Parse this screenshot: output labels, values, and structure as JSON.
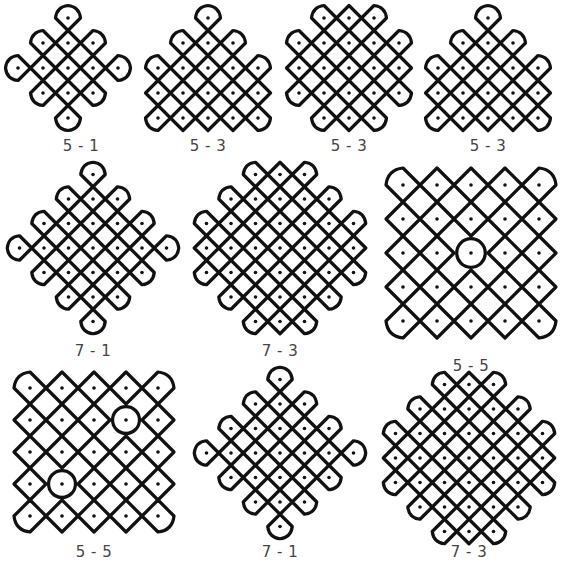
{
  "panels": [
    {
      "id": "p1",
      "caption": "5 - 1",
      "cx": 68,
      "cy": 68,
      "step": 25,
      "dots": [
        [
          0,
          -2
        ],
        [
          -1,
          -1
        ],
        [
          0,
          -1
        ],
        [
          1,
          -1
        ],
        [
          -2,
          0
        ],
        [
          -1,
          0
        ],
        [
          0,
          0
        ],
        [
          1,
          0
        ],
        [
          2,
          0
        ],
        [
          -1,
          1
        ],
        [
          0,
          1
        ],
        [
          1,
          1
        ],
        [
          0,
          2
        ]
      ],
      "caption_x": 41,
      "caption_y": 137
    },
    {
      "id": "p2",
      "caption": "5 - 3",
      "cx": 208,
      "cy": 68,
      "step": 25,
      "dots": [
        [
          0,
          -2
        ],
        [
          -1,
          -1
        ],
        [
          0,
          -1
        ],
        [
          1,
          -1
        ],
        [
          -2,
          0
        ],
        [
          -1,
          0
        ],
        [
          0,
          0
        ],
        [
          1,
          0
        ],
        [
          2,
          0
        ],
        [
          -2,
          1
        ],
        [
          -1,
          1
        ],
        [
          0,
          1
        ],
        [
          1,
          1
        ],
        [
          2,
          1
        ],
        [
          -2,
          2
        ],
        [
          -1,
          2
        ],
        [
          0,
          2
        ],
        [
          1,
          2
        ],
        [
          2,
          2
        ]
      ],
      "caption_x": 168,
      "caption_y": 137
    },
    {
      "id": "p3",
      "caption": "5 - 3",
      "cx": 349,
      "cy": 68,
      "step": 25,
      "dots": [
        [
          -1,
          -2
        ],
        [
          0,
          -2
        ],
        [
          1,
          -2
        ],
        [
          -2,
          -1
        ],
        [
          -1,
          -1
        ],
        [
          0,
          -1
        ],
        [
          1,
          -1
        ],
        [
          2,
          -1
        ],
        [
          -2,
          0
        ],
        [
          -1,
          0
        ],
        [
          0,
          0
        ],
        [
          1,
          0
        ],
        [
          2,
          0
        ],
        [
          -2,
          1
        ],
        [
          -1,
          1
        ],
        [
          0,
          1
        ],
        [
          1,
          1
        ],
        [
          2,
          1
        ],
        [
          -1,
          2
        ],
        [
          0,
          2
        ],
        [
          1,
          2
        ]
      ],
      "caption_x": 309,
      "caption_y": 137
    },
    {
      "id": "p4",
      "caption": "5 - 3",
      "cx": 488,
      "cy": 68,
      "step": 25,
      "dots": [
        [
          0,
          -2
        ],
        [
          -1,
          -1
        ],
        [
          0,
          -1
        ],
        [
          1,
          -1
        ],
        [
          -2,
          0
        ],
        [
          -1,
          0
        ],
        [
          0,
          0
        ],
        [
          1,
          0
        ],
        [
          2,
          0
        ],
        [
          -2,
          1
        ],
        [
          -1,
          1
        ],
        [
          0,
          1
        ],
        [
          1,
          1
        ],
        [
          2,
          1
        ],
        [
          -2,
          2
        ],
        [
          -1,
          2
        ],
        [
          0,
          2
        ],
        [
          1,
          2
        ],
        [
          2,
          2
        ]
      ],
      "caption_x": 448,
      "caption_y": 137
    },
    {
      "id": "p5",
      "caption": "7 - 1",
      "cx": 93,
      "cy": 248,
      "step": 24.5,
      "dots": [
        [
          0,
          -3
        ],
        [
          -1,
          -2
        ],
        [
          0,
          -2
        ],
        [
          1,
          -2
        ],
        [
          -2,
          -1
        ],
        [
          -1,
          -1
        ],
        [
          0,
          -1
        ],
        [
          1,
          -1
        ],
        [
          2,
          -1
        ],
        [
          -3,
          0
        ],
        [
          -2,
          0
        ],
        [
          -1,
          0
        ],
        [
          0,
          0
        ],
        [
          1,
          0
        ],
        [
          2,
          0
        ],
        [
          3,
          0
        ],
        [
          -2,
          1
        ],
        [
          -1,
          1
        ],
        [
          0,
          1
        ],
        [
          1,
          1
        ],
        [
          2,
          1
        ],
        [
          -1,
          2
        ],
        [
          0,
          2
        ],
        [
          1,
          2
        ],
        [
          0,
          3
        ]
      ],
      "caption_x": 53,
      "caption_y": 342
    },
    {
      "id": "p6",
      "caption": "7 - 3",
      "cx": 280,
      "cy": 248,
      "step": 24.5,
      "dots": [
        [
          -1,
          -3
        ],
        [
          0,
          -3
        ],
        [
          1,
          -3
        ],
        [
          -2,
          -2
        ],
        [
          -1,
          -2
        ],
        [
          0,
          -2
        ],
        [
          1,
          -2
        ],
        [
          2,
          -2
        ],
        [
          -3,
          -1
        ],
        [
          -2,
          -1
        ],
        [
          -1,
          -1
        ],
        [
          0,
          -1
        ],
        [
          1,
          -1
        ],
        [
          2,
          -1
        ],
        [
          3,
          -1
        ],
        [
          -3,
          0
        ],
        [
          -2,
          0
        ],
        [
          -1,
          0
        ],
        [
          0,
          0
        ],
        [
          1,
          0
        ],
        [
          2,
          0
        ],
        [
          3,
          0
        ],
        [
          -3,
          1
        ],
        [
          -2,
          1
        ],
        [
          -1,
          1
        ],
        [
          0,
          1
        ],
        [
          1,
          1
        ],
        [
          2,
          1
        ],
        [
          3,
          1
        ],
        [
          -2,
          2
        ],
        [
          -1,
          2
        ],
        [
          0,
          2
        ],
        [
          1,
          2
        ],
        [
          2,
          2
        ],
        [
          -1,
          3
        ],
        [
          0,
          3
        ],
        [
          1,
          3
        ]
      ],
      "caption_x": 240,
      "caption_y": 342
    },
    {
      "id": "p7",
      "caption": "5 - 5",
      "cx": 471,
      "cy": 253,
      "step": 34,
      "dots": [
        [
          -2,
          -2
        ],
        [
          -1,
          -2
        ],
        [
          0,
          -2
        ],
        [
          1,
          -2
        ],
        [
          2,
          -2
        ],
        [
          -2,
          -1
        ],
        [
          -1,
          -1
        ],
        [
          0,
          -1
        ],
        [
          1,
          -1
        ],
        [
          2,
          -1
        ],
        [
          -2,
          0
        ],
        [
          -1,
          0
        ],
        [
          0,
          0
        ],
        [
          1,
          0
        ],
        [
          2,
          0
        ],
        [
          -2,
          1
        ],
        [
          -1,
          1
        ],
        [
          0,
          1
        ],
        [
          1,
          1
        ],
        [
          2,
          1
        ],
        [
          -2,
          2
        ],
        [
          -1,
          2
        ],
        [
          0,
          2
        ],
        [
          1,
          2
        ],
        [
          2,
          2
        ]
      ],
      "circles": [
        [
          0,
          0
        ]
      ],
      "caption_x": 431,
      "caption_y": 357
    },
    {
      "id": "p8",
      "caption": "5 - 5",
      "cx": 94,
      "cy": 452,
      "step": 32,
      "dots": [
        [
          -2,
          -2
        ],
        [
          -1,
          -2
        ],
        [
          0,
          -2
        ],
        [
          1,
          -2
        ],
        [
          2,
          -2
        ],
        [
          -2,
          -1
        ],
        [
          -1,
          -1
        ],
        [
          0,
          -1
        ],
        [
          1,
          -1
        ],
        [
          2,
          -1
        ],
        [
          -2,
          0
        ],
        [
          -1,
          0
        ],
        [
          0,
          0
        ],
        [
          1,
          0
        ],
        [
          2,
          0
        ],
        [
          -2,
          1
        ],
        [
          -1,
          1
        ],
        [
          0,
          1
        ],
        [
          1,
          1
        ],
        [
          2,
          1
        ],
        [
          -2,
          2
        ],
        [
          -1,
          2
        ],
        [
          0,
          2
        ],
        [
          1,
          2
        ],
        [
          2,
          2
        ]
      ],
      "circles": [
        [
          1,
          -1
        ],
        [
          -1,
          1
        ]
      ],
      "caption_x": 54,
      "caption_y": 543
    },
    {
      "id": "p9",
      "caption": "7 - 1",
      "cx": 280,
      "cy": 453,
      "step": 24.5,
      "dots": [
        [
          0,
          -3
        ],
        [
          -1,
          -2
        ],
        [
          0,
          -2
        ],
        [
          1,
          -2
        ],
        [
          -2,
          -1
        ],
        [
          -1,
          -1
        ],
        [
          0,
          -1
        ],
        [
          1,
          -1
        ],
        [
          2,
          -1
        ],
        [
          -3,
          0
        ],
        [
          -2,
          0
        ],
        [
          -1,
          0
        ],
        [
          0,
          0
        ],
        [
          1,
          0
        ],
        [
          2,
          0
        ],
        [
          3,
          0
        ],
        [
          -2,
          1
        ],
        [
          -1,
          1
        ],
        [
          0,
          1
        ],
        [
          1,
          1
        ],
        [
          2,
          1
        ],
        [
          -1,
          2
        ],
        [
          0,
          2
        ],
        [
          1,
          2
        ],
        [
          0,
          3
        ]
      ],
      "caption_x": 240,
      "caption_y": 543
    },
    {
      "id": "p10",
      "caption": "7 - 3",
      "cx": 469,
      "cy": 458,
      "step": 24.5,
      "dots": [
        [
          -1,
          -3
        ],
        [
          0,
          -3
        ],
        [
          1,
          -3
        ],
        [
          -2,
          -2
        ],
        [
          -1,
          -2
        ],
        [
          0,
          -2
        ],
        [
          1,
          -2
        ],
        [
          2,
          -2
        ],
        [
          -3,
          -1
        ],
        [
          -2,
          -1
        ],
        [
          -1,
          -1
        ],
        [
          0,
          -1
        ],
        [
          1,
          -1
        ],
        [
          2,
          -1
        ],
        [
          3,
          -1
        ],
        [
          -3,
          0
        ],
        [
          -2,
          0
        ],
        [
          -1,
          0
        ],
        [
          0,
          0
        ],
        [
          1,
          0
        ],
        [
          2,
          0
        ],
        [
          3,
          0
        ],
        [
          -3,
          1
        ],
        [
          -2,
          1
        ],
        [
          -1,
          1
        ],
        [
          0,
          1
        ],
        [
          1,
          1
        ],
        [
          2,
          1
        ],
        [
          3,
          1
        ],
        [
          -2,
          2
        ],
        [
          -1,
          2
        ],
        [
          0,
          2
        ],
        [
          1,
          2
        ],
        [
          2,
          2
        ],
        [
          -1,
          3
        ],
        [
          0,
          3
        ],
        [
          1,
          3
        ]
      ],
      "caption_x": 429,
      "caption_y": 543
    }
  ],
  "colors": {
    "line": "#111111",
    "background": "#ffffff",
    "caption": "#444444"
  }
}
